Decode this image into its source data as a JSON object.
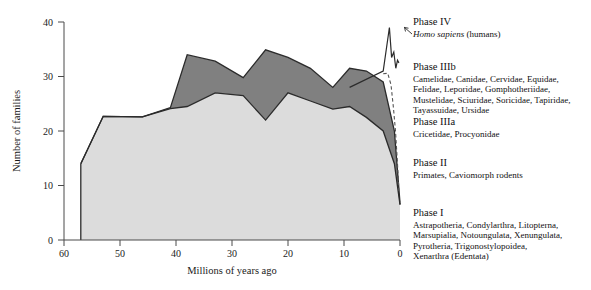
{
  "chart_data": {
    "type": "area",
    "title": "",
    "xlabel": "Millions of years ago",
    "ylabel": "Number of families",
    "xlim": [
      60,
      0
    ],
    "ylim": [
      0,
      40
    ],
    "x_ticks": [
      60,
      50,
      40,
      30,
      20,
      10,
      0
    ],
    "y_ticks": [
      0,
      10,
      20,
      30,
      40
    ],
    "x_reversed": true,
    "grid": false,
    "legend_position": "right",
    "stacked": true,
    "x": [
      57,
      53,
      46,
      41,
      38,
      33,
      28,
      24,
      20,
      16,
      12,
      9,
      6,
      3,
      1,
      0
    ],
    "series": [
      {
        "name": "Phase I + Phase II (lower band)",
        "color": "#dcdcdc",
        "values": [
          14,
          22.7,
          22.6,
          24.1,
          24.5,
          27,
          26.5,
          22,
          27,
          25.5,
          24,
          24.5,
          22.5,
          20,
          14,
          6.5
        ]
      },
      {
        "name": "Phase IIIa + Phase IIIb (upper band)",
        "color": "#808080",
        "values": [
          14,
          22.7,
          22.6,
          24.3,
          34,
          32.8,
          29.8,
          34.9,
          33.5,
          31.5,
          28,
          31.5,
          31,
          29,
          20,
          6.8
        ]
      }
    ],
    "annotations": [
      {
        "name": "phase-iv-spike",
        "label": "Homo sapiens spike",
        "points": [
          [
            9,
            28
          ],
          [
            3,
            31
          ],
          [
            1.9,
            39
          ],
          [
            1.5,
            33.5
          ],
          [
            1.1,
            34.5
          ],
          [
            0.75,
            31.5
          ],
          [
            0.45,
            33
          ],
          [
            0.2,
            32.5
          ]
        ]
      },
      {
        "name": "phase-iiib-dashed",
        "label": "Phase IIIb dashed continuation",
        "points": [
          [
            3,
            30.5
          ],
          [
            2.2,
            30.6
          ],
          [
            1.6,
            28.5
          ],
          [
            1.2,
            24.5
          ],
          [
            0.8,
            20
          ],
          [
            0.45,
            14
          ],
          [
            0.2,
            9
          ]
        ]
      }
    ]
  },
  "legend": {
    "groups": [
      {
        "title": "Phase IV",
        "lines": [
          "Homo sapiens (humans)"
        ],
        "italic_first": true,
        "italic_text": "Homo sapiens",
        "roman_text": " (humans)"
      },
      {
        "title": "Phase IIIb",
        "lines": [
          "Camelidae, Canidae, Cervidae, Equidae,",
          "Felidae, Leporidae, Gomphotheriidae,",
          "Mustelidae, Sciuridae, Soricidae, Tapiridae,",
          "Tayassuidae, Ursidae"
        ]
      },
      {
        "title": "Phase IIIa",
        "lines": [
          "Cricetidae, Procyonidae"
        ]
      },
      {
        "title": "Phase II",
        "lines": [
          "Primates, Caviomorph rodents"
        ]
      },
      {
        "title": "Phase I",
        "lines": [
          "Astrapotheria, Condylarthra, Litopterna,",
          "Marsupialia, Notoungulata, Xenungulata,",
          "Pyrotheria, Trigonostylopoidea,",
          "Xenarthra (Edentata)"
        ]
      }
    ]
  },
  "colors": {
    "lower_band": "#dcdcdc",
    "upper_band": "#808080",
    "outline": "#2b2b2b",
    "axis": "#4a4a4a",
    "background": "#ffffff"
  }
}
